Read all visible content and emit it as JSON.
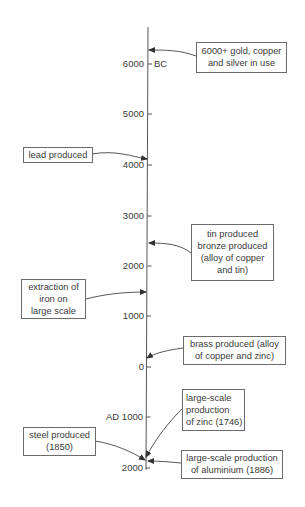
{
  "timeline": {
    "era_labels": {
      "bc": "BC"
    },
    "ticks": [
      {
        "label": "6000",
        "y": 64
      },
      {
        "label": "5000",
        "y": 114
      },
      {
        "label": "4000",
        "y": 165
      },
      {
        "label": "3000",
        "y": 216
      },
      {
        "label": "2000",
        "y": 266
      },
      {
        "label": "1000",
        "y": 316
      },
      {
        "label": "0",
        "y": 367
      },
      {
        "label": "AD 1000",
        "y": 417
      },
      {
        "label": "2000",
        "y": 468
      }
    ]
  },
  "events": [
    {
      "id": "gold",
      "lines": [
        "6000+ gold, copper",
        "and silver in use"
      ]
    },
    {
      "id": "lead",
      "lines": [
        "lead produced"
      ]
    },
    {
      "id": "tin",
      "lines": [
        "tin produced",
        "bronze produced",
        "(alloy of copper",
        "and tin)"
      ]
    },
    {
      "id": "iron",
      "lines": [
        "extraction of",
        "iron on",
        "large scale"
      ]
    },
    {
      "id": "brass",
      "lines": [
        "brass produced (alloy",
        "of copper and zinc)"
      ]
    },
    {
      "id": "zinc",
      "lines": [
        "large-scale",
        "production",
        "of zinc (1746)"
      ]
    },
    {
      "id": "steel",
      "lines": [
        "steel produced",
        "(1850)"
      ]
    },
    {
      "id": "aluminium",
      "lines": [
        "large-scale production",
        "of aluminium (1886)"
      ]
    }
  ],
  "colors": {
    "line": "#555555",
    "text": "#3a3a3a",
    "box_border": "#6b6b6b"
  }
}
